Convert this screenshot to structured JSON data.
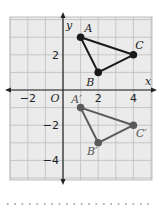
{
  "figure": {
    "grid": {
      "xmin": -3,
      "xmax": 5,
      "ymin": -5,
      "ymax": 4,
      "fill": "#ebebeb",
      "line_color": "#bdbdbd"
    },
    "axes": {
      "x_label": "x",
      "y_label": "y",
      "origin_label": "O",
      "x_ticks": [
        {
          "v": -2,
          "label": "−2"
        },
        {
          "v": 2,
          "label": "2"
        },
        {
          "v": 4,
          "label": "4"
        }
      ],
      "y_ticks": [
        {
          "v": 2,
          "label": "2"
        },
        {
          "v": -2,
          "label": "−2"
        },
        {
          "v": -4,
          "label": "−4"
        }
      ]
    },
    "preimage": {
      "color": "#1a1a1a",
      "points": [
        {
          "name": "A",
          "x": 1,
          "y": 3
        },
        {
          "name": "B",
          "x": 2,
          "y": 1
        },
        {
          "name": "C",
          "x": 4,
          "y": 2
        }
      ]
    },
    "image": {
      "color": "#5a5a5a",
      "points": [
        {
          "name": "A′",
          "x": 1,
          "y": -1
        },
        {
          "name": "B′",
          "x": 2,
          "y": -3
        },
        {
          "name": "C′",
          "x": 4,
          "y": -2
        }
      ]
    }
  }
}
